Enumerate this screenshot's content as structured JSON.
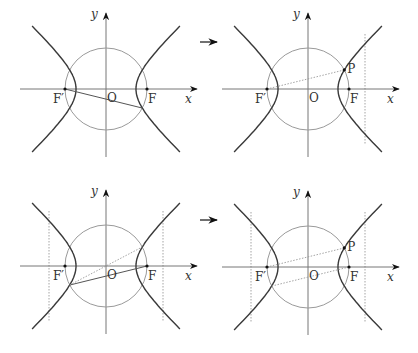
{
  "panels": [
    {
      "id": "panel-1",
      "origin": [
        106,
        89
      ],
      "labels": {
        "y_axis": "y",
        "x_axis": "x",
        "origin": "O",
        "focus_left": "F′",
        "focus_right": "F"
      },
      "segments": [
        {
          "from": "F′",
          "to": "lower-right-intersection",
          "style": "solid"
        }
      ],
      "dotted_verticals": [],
      "point_P": null,
      "arrow_before": false
    },
    {
      "id": "panel-2",
      "origin": [
        308,
        89
      ],
      "labels": {
        "y_axis": "y",
        "x_axis": "x",
        "origin": "O",
        "focus_left": "F′",
        "focus_right": "F",
        "point": "P"
      },
      "segments": [
        {
          "from": "F′",
          "to": "P",
          "style": "dotted"
        }
      ],
      "dotted_verticals": [
        "right"
      ],
      "point_P": "upper-right-intersection",
      "arrow_before": true
    },
    {
      "id": "panel-3",
      "origin": [
        106,
        266
      ],
      "labels": {
        "y_axis": "y",
        "x_axis": "x",
        "origin": "O",
        "focus_left": "F′",
        "focus_right": "F"
      },
      "segments": [
        {
          "from": "lower-left-intersection",
          "to": "F",
          "style": "solid"
        },
        {
          "from": "lower-left-intersection",
          "to": "upper-right-intersection",
          "style": "dotted"
        }
      ],
      "dotted_verticals": [
        "left",
        "right"
      ],
      "point_P": null,
      "arrow_before": false
    },
    {
      "id": "panel-4",
      "origin": [
        308,
        267
      ],
      "labels": {
        "y_axis": "y",
        "x_axis": "x",
        "origin": "O",
        "focus_left": "F′",
        "focus_right": "F",
        "point": "P"
      },
      "segments": [
        {
          "from": "F′",
          "to": "P",
          "style": "dotted"
        },
        {
          "from": "lower-left-intersection",
          "to": "F",
          "style": "dotted"
        }
      ],
      "dotted_verticals": [
        "left",
        "right"
      ],
      "point_P": "upper-right-intersection",
      "arrow_before": true
    }
  ],
  "geometry": {
    "a": 30,
    "c": 41,
    "circle_radius": 41,
    "directrix_offset": 57
  },
  "colors": {
    "curve": "#3a3a3a",
    "axis": "#777777",
    "circle": "#9a9a9a",
    "dotted": "#9a9a9a",
    "text": "#333333"
  }
}
